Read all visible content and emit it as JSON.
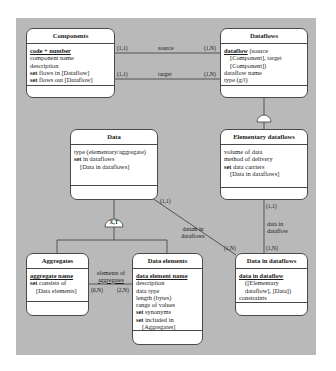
{
  "diagram": {
    "background_color": "#b9b9b9",
    "entities": {
      "components": {
        "title": "Components",
        "attributes": [
          {
            "text": "code + number",
            "style": "key"
          },
          {
            "text": "component name"
          },
          {
            "text": "description"
          },
          {
            "kw": "set",
            "text": " flows in [Dataflow]"
          },
          {
            "kw": "set",
            "text": " flows out [Dataflow]"
          }
        ]
      },
      "dataflows": {
        "title": "Dataflows",
        "attributes": [
          {
            "key": "dataflow",
            "text": " (source"
          },
          {
            "text": "[Component], target",
            "indent": true
          },
          {
            "text": "[Component])",
            "indent": true
          },
          {
            "text": "dataflow name"
          },
          {
            "text": "type (g/l)"
          }
        ]
      },
      "data": {
        "title": "Data",
        "attributes": [
          {
            "text": "type (elementary/aggregate)"
          },
          {
            "kw": "set",
            "text": " in dataflows"
          },
          {
            "text": "[Data in dataflows]",
            "indent": true
          }
        ]
      },
      "elementary_dataflows": {
        "title": "Elementary dataflows",
        "attributes": [
          {
            "text": "volume of data"
          },
          {
            "text": "method of delivery"
          },
          {
            "kw": "set",
            "text": " data carriers"
          },
          {
            "text": "[Data in dataflows]",
            "indent": true
          }
        ]
      },
      "aggregates": {
        "title": "Aggregates",
        "attributes": [
          {
            "text": "aggregate name",
            "style": "key"
          },
          {
            "kw": "set",
            "text": " consists of"
          },
          {
            "text": "[Data elements]",
            "indent": true
          }
        ]
      },
      "data_elements": {
        "title": "Data elements",
        "attributes": [
          {
            "text": "data element name",
            "style": "key"
          },
          {
            "text": "description"
          },
          {
            "text": "data type"
          },
          {
            "text": "length (bytes)"
          },
          {
            "text": "range of values"
          },
          {
            "kw": "set",
            "text": " synonyms"
          },
          {
            "kw": "set",
            "text": " included in"
          },
          {
            "text": "[Aggregates]",
            "indent": true
          }
        ]
      },
      "data_in_dataflows": {
        "title": "Data in dataflows",
        "attributes": [
          {
            "text": "data in dataflow",
            "style": "key"
          },
          {
            "text": "([Elementary",
            "indent": true
          },
          {
            "text": "dataflow], [Data])",
            "indent": true
          },
          {
            "text": "constraints"
          }
        ]
      }
    },
    "relationships": {
      "source": {
        "label": "source",
        "card_left": "(1,1)",
        "card_right": "(1,N)"
      },
      "target": {
        "label": "target",
        "card_left": "(1,1)",
        "card_right": "(1,N)"
      },
      "datum_in_dataflows": {
        "label_line1": "datum in",
        "label_line2": "dataflows",
        "card_from": "(1,1)",
        "card_to": "(1,N)"
      },
      "data_in_dataflow": {
        "label_line1": "data in",
        "label_line2": "dataflow",
        "card_from": "(1,1)",
        "card_to": "(1,N)"
      },
      "elements_of_aggregates": {
        "label_line1": "elements of",
        "label_line2": "aggregates",
        "card_left": "(0,N)",
        "card_right": "(2,N)"
      }
    },
    "generalizations": {
      "data": {
        "label": "X,T"
      },
      "dataflows": {
        "label": ""
      }
    }
  }
}
